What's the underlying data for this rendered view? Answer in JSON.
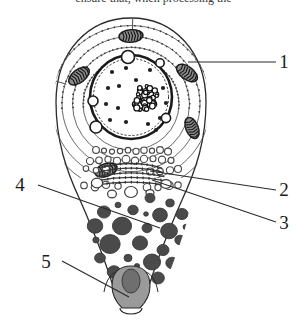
{
  "figure": {
    "title_fragment": "ensure that, when processing the",
    "alt_description": "Schematic drawing of a secretory (glandular) cell in cross-section showing concentric rough endoplasmic reticulum, nucleus with nucleolus, mitochondria, Golgi apparatus with vesicles, secretory granules and an apical opening.",
    "background_color": "#ffffff",
    "ink_color": "#1b1b1b"
  },
  "labels": [
    {
      "id": "1",
      "text": "1",
      "x": 284,
      "y": 68,
      "line_x1": 276,
      "line_y1": 62,
      "line_x2": 188,
      "line_y2": 62,
      "target": "rough-endoplasmic-reticulum"
    },
    {
      "id": "2",
      "text": "2",
      "x": 284,
      "y": 196,
      "line_x1": 276,
      "line_y1": 190,
      "line_x2": 150,
      "line_y2": 171,
      "target": "golgi-apparatus"
    },
    {
      "id": "3",
      "text": "3",
      "x": 284,
      "y": 229,
      "line_x1": 276,
      "line_y1": 222,
      "line_x2": 152,
      "line_y2": 180,
      "target": "golgi-vesicles"
    },
    {
      "id": "4",
      "text": "4",
      "x": 20,
      "y": 191,
      "line_x1": 38,
      "line_y1": 185,
      "line_x2": 160,
      "line_y2": 228,
      "target": "secretory-granules"
    },
    {
      "id": "5",
      "text": "5",
      "x": 46,
      "y": 268,
      "line_x1": 62,
      "line_y1": 261,
      "line_x2": 129,
      "line_y2": 297,
      "target": "apical-opening"
    }
  ],
  "structures": {
    "cell_outline": {
      "name": "cell-outline",
      "stroke": "#2b2b2b"
    },
    "er_layers": {
      "name": "rough-endoplasmic-reticulum",
      "count": 7,
      "stroke": "#4e4e4e",
      "ribosome_color": "#3c3c3c"
    },
    "nucleus": {
      "name": "nucleus",
      "cx": 131,
      "cy": 97,
      "rx": 41,
      "ry": 42,
      "stroke": "#1e1e1e"
    },
    "nucleolus": {
      "name": "nucleolus",
      "cx": 144,
      "cy": 98,
      "r": 15,
      "fill": "#262626"
    },
    "chromatin": {
      "name": "chromatin-granules",
      "count": 13,
      "fill": "#1f1f1f"
    },
    "nuclear_pores": {
      "name": "nuclear-pores",
      "count": 5,
      "fill": "#ffffff"
    },
    "mitochondria": {
      "name": "mitochondria",
      "count": 5,
      "fill": "#8c8c8c",
      "stroke": "#1f1f1f"
    },
    "golgi": {
      "name": "golgi-apparatus",
      "stacks": 5,
      "stroke": "#3a3a3a"
    },
    "vesicles": {
      "name": "transport-vesicles",
      "count": 34,
      "stroke": "#4a4a4a",
      "fill": "#ffffff"
    },
    "granules": {
      "name": "secretory-granules",
      "count": 21,
      "fill": "#4a4a4a",
      "stroke": "#333333"
    },
    "apical": {
      "name": "apical-opening",
      "fill": "#9a9a9a",
      "stroke": "#2b2b2b"
    }
  }
}
